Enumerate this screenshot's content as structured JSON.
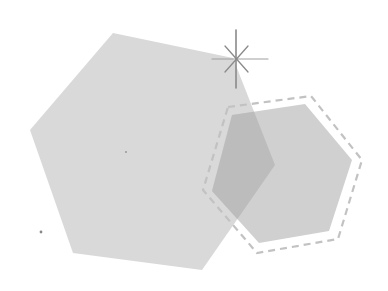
{
  "scene": {
    "description": "Two overlapping gray hexagons with a dashed outline and a sparkle star",
    "colors": {
      "background": "#ffffff",
      "large_hexagon": "#d8d8d8",
      "small_hexagon": "#cfcfcf",
      "overlap": "#bdbdbd",
      "dashed_outline": "#c4c4c4",
      "sparkle": "#8c8c8c"
    },
    "shapes": {
      "large_hexagon_points": "113,33 233,58 275,165 202,270 73,253 30,130",
      "small_hexagon_points": "232,115 305,104 352,160 329,231 259,243 212,191",
      "dashed_outline_points": "228,107 311,96 362,160 338,239 257,253 203,190",
      "sparkle_center": [
        236,
        59
      ]
    }
  }
}
